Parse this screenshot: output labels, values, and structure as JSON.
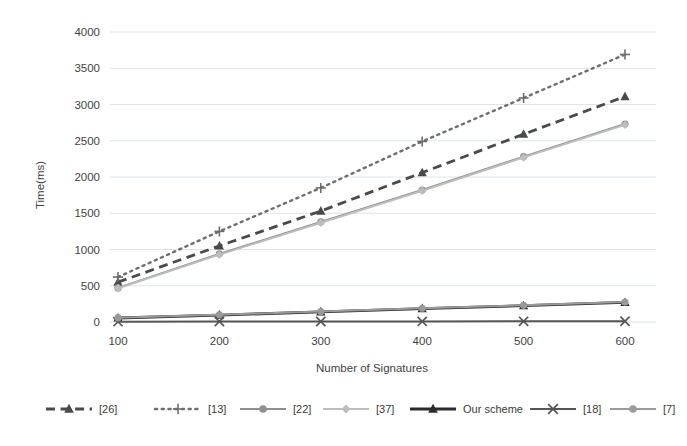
{
  "chart_data": {
    "type": "line",
    "title": "",
    "xlabel": "Number of Signatures",
    "ylabel": "Time(ms)",
    "x": [
      100,
      200,
      300,
      400,
      500,
      600
    ],
    "xticklabels": [
      "100",
      "200",
      "300",
      "400",
      "500",
      "600"
    ],
    "yticklabels": [
      "0",
      "500",
      "1000",
      "1500",
      "2000",
      "2500",
      "3000",
      "3500",
      "4000"
    ],
    "yticks": [
      0,
      500,
      1000,
      1500,
      2000,
      2500,
      3000,
      3500,
      4000
    ],
    "xlim": [
      100,
      600
    ],
    "ylim": [
      0,
      4000
    ],
    "grid": true,
    "grid_axis": "y",
    "legend_position": "bottom",
    "series": [
      {
        "name": "[26]",
        "values": [
          550,
          1050,
          1530,
          2060,
          2590,
          3110
        ],
        "color": "#4a4a4a",
        "linestyle": "dashed",
        "marker": "triangle"
      },
      {
        "name": "[13]",
        "values": [
          620,
          1250,
          1850,
          2490,
          3090,
          3690
        ],
        "color": "#6e6e6e",
        "linestyle": "dotted",
        "marker": "plus"
      },
      {
        "name": "[22]",
        "values": [
          470,
          940,
          1380,
          1820,
          2280,
          2730
        ],
        "color": "#8f8f8f",
        "linestyle": "solid",
        "marker": "circle"
      },
      {
        "name": "[37]",
        "values": [
          465,
          930,
          1370,
          1810,
          2270,
          2720
        ],
        "color": "#bdbdbd",
        "linestyle": "solid",
        "marker": "diamond"
      },
      {
        "name": "Our scheme",
        "values": [
          55,
          95,
          140,
          185,
          225,
          270
        ],
        "color": "#2b2b2b",
        "linestyle": "solid",
        "marker": "triangle"
      },
      {
        "name": "[18]",
        "values": [
          5,
          6,
          7,
          8,
          9,
          10
        ],
        "color": "#555555",
        "linestyle": "solid",
        "marker": "cross"
      },
      {
        "name": "[7]",
        "values": [
          60,
          100,
          145,
          190,
          230,
          275
        ],
        "color": "#9a9a9a",
        "linestyle": "solid",
        "marker": "circle"
      }
    ]
  },
  "legend": {
    "items": [
      {
        "label": "[26]"
      },
      {
        "label": "[13]"
      },
      {
        "label": "[22]"
      },
      {
        "label": "[37]"
      },
      {
        "label": "Our scheme"
      },
      {
        "label": "[18]"
      },
      {
        "label": "[7]"
      }
    ]
  },
  "axes": {
    "x_title": "Number of Signatures",
    "y_title": "Time(ms)"
  },
  "colors": {
    "gridline": "#d6dde4",
    "text": "#3f3f3f",
    "background": "#ffffff"
  }
}
